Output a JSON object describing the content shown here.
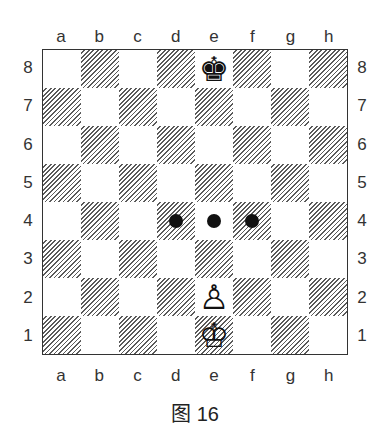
{
  "diagram": {
    "type": "chess-board",
    "files": [
      "a",
      "b",
      "c",
      "d",
      "e",
      "f",
      "g",
      "h"
    ],
    "ranks": [
      "8",
      "7",
      "6",
      "5",
      "4",
      "3",
      "2",
      "1"
    ],
    "pieces": [
      {
        "square": "e8",
        "piece": "king",
        "color": "black",
        "icon": "black-king-icon",
        "glyph": "♚"
      },
      {
        "square": "e2",
        "piece": "pawn",
        "color": "white",
        "icon": "white-pawn-icon",
        "glyph": "♙"
      },
      {
        "square": "e1",
        "piece": "king",
        "color": "white",
        "icon": "white-king-icon",
        "glyph": "♔"
      }
    ],
    "markers": [
      {
        "square": "d4",
        "type": "dot"
      },
      {
        "square": "e4",
        "type": "dot"
      },
      {
        "square": "f4",
        "type": "dot"
      }
    ],
    "colors": {
      "dark_square_hatch": "#5a5a5a",
      "light_square": "#ffffff",
      "border": "#333333",
      "marker": "#111111"
    }
  },
  "caption": {
    "prefix": "图",
    "number": "16"
  }
}
